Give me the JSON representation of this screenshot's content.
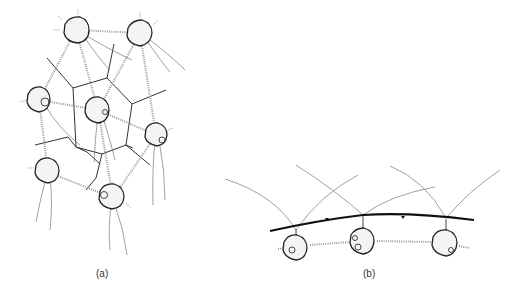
{
  "figure": {
    "panels": [
      {
        "id": "a",
        "label": "(a)",
        "description": "Seven spherical cells connected by dotted strands, overlaid on a polygonal (Voronoi-like) network of walls, each cell with trailing flagella"
      },
      {
        "id": "b",
        "label": "(b)",
        "description": "Three spherical cells hanging below a thick curved membrane line, connected by dotted strands, with long arching filaments above"
      }
    ]
  }
}
